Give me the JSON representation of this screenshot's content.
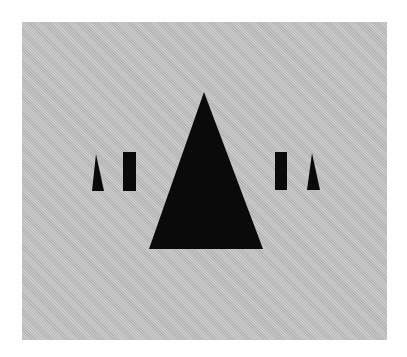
{
  "figure": {
    "background_color": "#c4c4c4",
    "shape_color": "#0a0a0a",
    "shapes": [
      {
        "name": "left-small-triangle",
        "type": "triangle",
        "points": "96,154 92,191 104,191"
      },
      {
        "name": "left-rectangle",
        "type": "rectangle",
        "x": 123,
        "y": 152,
        "width": 13,
        "height": 39
      },
      {
        "name": "central-large-triangle",
        "type": "triangle",
        "points": "204,92 149,249 263,249"
      },
      {
        "name": "right-rectangle",
        "type": "rectangle",
        "x": 275,
        "y": 152,
        "width": 12,
        "height": 38
      },
      {
        "name": "right-small-triangle",
        "type": "triangle",
        "points": "312,153 307,190 320,190"
      }
    ]
  }
}
